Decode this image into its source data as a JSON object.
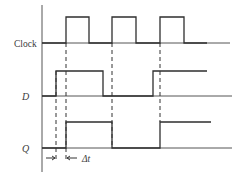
{
  "diagram": {
    "signals": [
      {
        "name": "clock",
        "label": "Clock",
        "italic": false
      },
      {
        "name": "d",
        "label": "D",
        "italic": true
      },
      {
        "name": "q",
        "label": "Q",
        "italic": true
      }
    ],
    "annotation": {
      "delay_label": "Δt"
    },
    "colors": {
      "line": "#2e2e2e",
      "text": "#3a3a3a",
      "background": "#ffffff"
    }
  }
}
